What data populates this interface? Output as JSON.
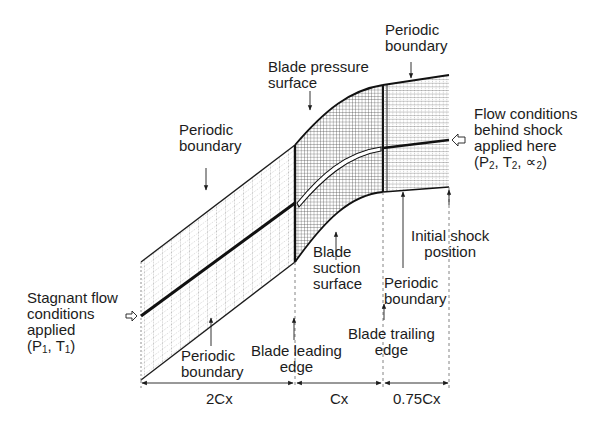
{
  "figure": {
    "type": "CFD computational mesh for a turbine/compressor blade passage",
    "colors": {
      "ink": "#1c1c1c",
      "mesh": "#3a3a3a",
      "background": "#ffffff"
    }
  },
  "labels": {
    "periodic_boundary_upper_left": [
      "Periodic",
      "boundary"
    ],
    "blade_pressure_surface": [
      "Blade pressure",
      "surface"
    ],
    "periodic_boundary_upper_right": [
      "Periodic",
      "boundary"
    ],
    "flow_conditions_behind_shock": [
      "Flow conditions",
      "behind shock",
      "applied here"
    ],
    "flow_conditions_params": {
      "open": "(P",
      "p_sub": "2",
      "mid1": ", T",
      "t_sub": "2",
      "mid2": ", ∝",
      "a_sub": "2",
      "close": ")"
    },
    "stagnant_flow": [
      "Stagnant flow",
      "conditions",
      "applied"
    ],
    "stagnant_params": {
      "open": "(P",
      "p_sub": "1",
      "mid": ", T",
      "t_sub": "1",
      "close": ")"
    },
    "periodic_boundary_lower_left": [
      "Periodic",
      "boundary"
    ],
    "blade_leading_edge": [
      "Blade leading",
      "edge"
    ],
    "blade_suction_surface": [
      "Blade",
      "suction",
      "surface"
    ],
    "periodic_boundary_lower_right": [
      "Periodic",
      "boundary"
    ],
    "blade_trailing_edge": [
      "Blade trailing",
      "edge"
    ],
    "initial_shock_position": [
      "Initial shock",
      "position"
    ]
  },
  "dimensions": [
    {
      "label": "2Cx",
      "from_x": 141,
      "to_x": 295
    },
    {
      "label": "Cx",
      "from_x": 295,
      "to_x": 383
    },
    {
      "label": "0.75Cx",
      "from_x": 383,
      "to_x": 449
    }
  ],
  "geometry": {
    "inlet_x": 141,
    "leading_edge_x": 295,
    "trailing_edge_x": 383,
    "outlet_x": 449,
    "dimension_line_y": 383
  }
}
